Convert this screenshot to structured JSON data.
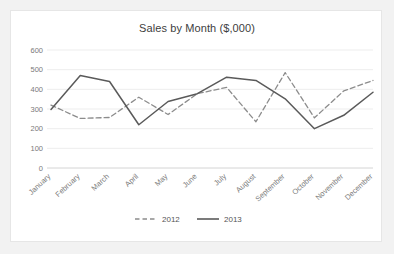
{
  "chart_data": {
    "type": "line",
    "title": "Sales by Month ($,000)",
    "xlabel": "",
    "ylabel": "",
    "ylim": [
      0,
      600
    ],
    "yticks": [
      0,
      100,
      200,
      300,
      400,
      500,
      600
    ],
    "ytick_labels": [
      "0",
      "100",
      "200",
      "300",
      "400",
      "500",
      "600"
    ],
    "grid": true,
    "legend_position": "bottom",
    "categories": [
      "January",
      "February",
      "March",
      "April",
      "May",
      "June",
      "July",
      "August",
      "September",
      "October",
      "November",
      "December"
    ],
    "series": [
      {
        "name": "2012",
        "style": "dashed",
        "color": "#8c8c8c",
        "values": [
          320,
          252,
          257,
          360,
          272,
          378,
          410,
          235,
          485,
          255,
          392,
          445
        ]
      },
      {
        "name": "2013",
        "style": "solid",
        "color": "#5a5a5a",
        "values": [
          298,
          470,
          440,
          220,
          338,
          378,
          462,
          445,
          352,
          200,
          268,
          385
        ]
      }
    ]
  },
  "legend": {
    "items": [
      {
        "label": "2012",
        "style": "dashed"
      },
      {
        "label": "2013",
        "style": "solid"
      }
    ]
  },
  "colors": {
    "page_background": "#f2f2f2",
    "card_background": "#ffffff",
    "card_border": "#e6e6e6",
    "gridline": "#e9e9e9",
    "axis": "#cfcfcf",
    "title_text": "#404040",
    "tick_text": "#7a7a7a",
    "series_2012": "#8c8c8c",
    "series_2013": "#5a5a5a"
  }
}
